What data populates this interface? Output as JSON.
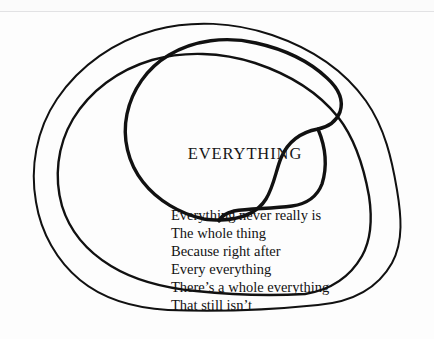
{
  "artwork": {
    "type": "hand-drawn-spiral-poem",
    "background_color": "#fdfdfd",
    "ink_color": "#111111",
    "center_word": "EVERYTHING",
    "poem_lines": [
      "Everything never really is",
      "The whole thing",
      "Because right after",
      "Every everything",
      "There’s a whole everything",
      "That still isn’t"
    ],
    "spiral": {
      "coils": 3,
      "stroke_color": "#111111",
      "outer_stroke_width": 2.0,
      "middle_stroke_width": 2.4,
      "inner_stroke_width": 3.4,
      "terminates_at": "Everything never really is"
    }
  }
}
